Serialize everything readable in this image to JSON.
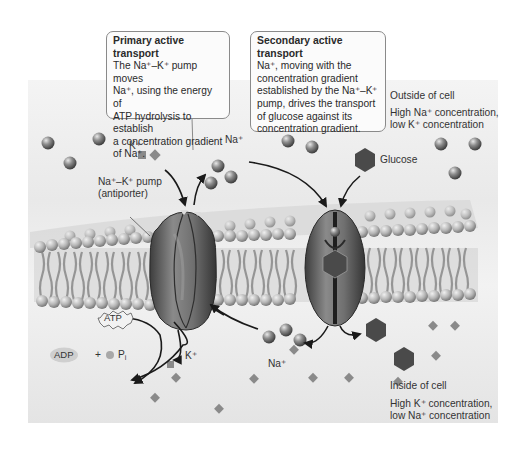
{
  "diagram": {
    "type": "biology-illustration",
    "callouts": {
      "primary": {
        "title": "Primary active transport",
        "line1": "The Na⁺–K⁺ pump moves",
        "line2": "Na⁺, using the energy of",
        "line3": "ATP hydrolysis to establish",
        "line4": "a concentration gradient",
        "line5": "of Na⁺."
      },
      "secondary": {
        "title": "Secondary active transport",
        "line1": "Na⁺, moving with the",
        "line2": "concentration gradient",
        "line3": "established by the Na⁺–K⁺",
        "line4": "pump, drives the transport",
        "line5": "of glucose against its",
        "line6": "concentration gradient."
      }
    },
    "labels": {
      "outside_title": "Outside of cell",
      "outside_line1": "High Na⁺ concentration,",
      "outside_line2": "low K⁺ concentration",
      "inside_title": "Inside of cell",
      "inside_line1": "High K⁺ concentration,",
      "inside_line2": "low Na⁺ concentration",
      "pump_line1": "Na⁺–K⁺ pump",
      "pump_line2": "(antiporter)",
      "k_top": "K⁺",
      "na_top": "Na⁺",
      "glucose": "Glucose",
      "atp": "ATP",
      "adp": "ADP",
      "plus": "+",
      "pi": "P",
      "pi_sub": "i",
      "k_bottom": "K⁺",
      "na_bottom": "Na⁺"
    },
    "legend_shapes": {
      "sodium": "sphere (gray)",
      "potassium": "small diamond/square (gray)",
      "glucose": "hexagon (dark gray)"
    },
    "colors": {
      "panel": "#ececec",
      "protein": "#6a6a6a",
      "lipid_head": "#b8b8b8",
      "lipid_tail": "#8e8e8e",
      "glucose": "#4a4a4a",
      "potassium": "#8a8a8a",
      "arrow": "#1a1a1a"
    }
  }
}
